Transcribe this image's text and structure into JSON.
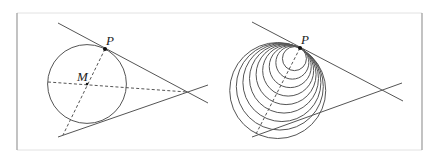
{
  "colors": {
    "stroke": "#555555",
    "frame": "#9a9a9a",
    "frame_faint": "#e2e2e2",
    "point": "#111111",
    "background": "#ffffff"
  },
  "frame": {
    "x1": 17,
    "y1": 13,
    "x2": 422,
    "y2": 150
  },
  "left_figure": {
    "labels": {
      "P": "P",
      "M": "M"
    },
    "P": [
      105,
      49
    ],
    "M": [
      87,
      84
    ],
    "circle_radius": 39.4,
    "upper_line": [
      [
        58,
        23
      ],
      [
        208,
        103
      ]
    ],
    "lower_line": [
      [
        58,
        137
      ],
      [
        208,
        85
      ]
    ],
    "dashed_axis": [
      [
        48,
        82
      ],
      [
        187,
        92
      ]
    ],
    "dashed_perpendicular": [
      [
        105,
        49
      ],
      [
        63,
        135
      ]
    ],
    "label_positions": {
      "P": [
        106,
        45
      ],
      "M": [
        77,
        81
      ]
    }
  },
  "right_figure": {
    "labels": {
      "P": "P"
    },
    "P": [
      300,
      48
    ],
    "upper_line": [
      [
        252,
        22
      ],
      [
        403,
        101
      ]
    ],
    "lower_line": [
      [
        252,
        137
      ],
      [
        402,
        83
      ]
    ],
    "dashed_perpendicular": [
      [
        300,
        48
      ],
      [
        256,
        134
      ]
    ],
    "normal_direction": [
      -0.464,
      0.886
    ],
    "circle_radii": [
      12,
      16.5,
      21,
      25.5,
      30,
      34.5,
      39,
      43.5,
      48
    ],
    "label_position": [
      301,
      44
    ]
  }
}
